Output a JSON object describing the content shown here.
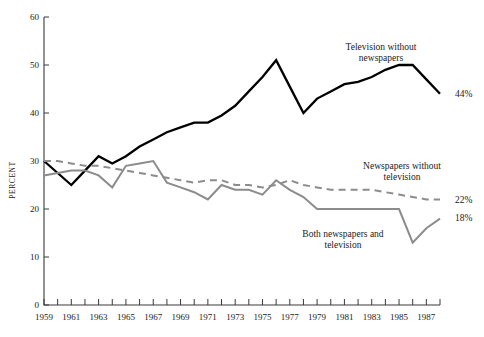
{
  "chart_data": {
    "type": "line",
    "title": "",
    "xlabel": "",
    "ylabel": "PERCENT",
    "xlim": [
      1959,
      1988
    ],
    "ylim": [
      0,
      60
    ],
    "grid": false,
    "legend_position": "inline-annotations",
    "x_tick_labels": [
      "1959",
      "1961",
      "1963",
      "1965",
      "1967",
      "1969",
      "1971",
      "1973",
      "1975",
      "1977",
      "1979",
      "1981",
      "1983",
      "1985",
      "1987"
    ],
    "y_tick_labels": [
      "0",
      "10",
      "20",
      "30",
      "40",
      "50",
      "60"
    ],
    "x_tick_values": [
      1959,
      1961,
      1963,
      1965,
      1967,
      1969,
      1971,
      1973,
      1975,
      1977,
      1979,
      1981,
      1983,
      1985,
      1987
    ],
    "y_tick_values": [
      0,
      10,
      20,
      30,
      40,
      50,
      60
    ],
    "x": [
      1959,
      1960,
      1961,
      1962,
      1963,
      1964,
      1965,
      1966,
      1967,
      1968,
      1969,
      1970,
      1971,
      1972,
      1973,
      1974,
      1975,
      1976,
      1977,
      1978,
      1979,
      1980,
      1981,
      1982,
      1983,
      1984,
      1985,
      1986,
      1987,
      1988
    ],
    "series": [
      {
        "name": "Television without newspapers",
        "color": "#000000",
        "style": "solid",
        "end_label": "44%",
        "annotation": "Television without newspapers",
        "values": [
          30,
          27.5,
          25,
          28,
          31,
          29.5,
          31,
          33,
          34.5,
          36,
          37,
          38,
          38,
          39.5,
          41.5,
          44.5,
          47.5,
          51,
          45.5,
          40,
          43,
          44.5,
          46,
          46.5,
          47.5,
          49,
          50,
          50,
          47,
          44
        ]
      },
      {
        "name": "Newspapers without television",
        "color": "#8c8c8c",
        "style": "dashed",
        "end_label": "22%",
        "annotation": "Newspapers without television",
        "values": [
          30,
          30,
          29.5,
          29,
          29,
          28.5,
          28,
          27.5,
          27,
          26.5,
          26,
          25.5,
          26,
          26,
          25,
          25,
          24.5,
          25,
          26,
          25,
          24.5,
          24,
          24,
          24,
          24,
          23.5,
          23,
          22.5,
          22,
          22
        ]
      },
      {
        "name": "Both newspapers and television",
        "color": "#8c8c8c",
        "style": "solid",
        "end_label": "18%",
        "annotation": "Both newspapers and television",
        "values": [
          27,
          27.5,
          28,
          28,
          27,
          24.5,
          29,
          29.5,
          30,
          25.5,
          24.5,
          23.5,
          22,
          25,
          24,
          24,
          23,
          26,
          24,
          22.5,
          20,
          20,
          20,
          20,
          20,
          20,
          20,
          13,
          16,
          18
        ]
      }
    ],
    "annotations": [
      {
        "text_line1": "Television without",
        "text_line2": "newspapers",
        "x_px": 381,
        "y_px": 50
      },
      {
        "text_line1": "Newspapers without",
        "text_line2": "television",
        "x_px": 402,
        "y_px": 169
      },
      {
        "text_line1": "Both newspapers and",
        "text_line2": "television",
        "x_px": 343,
        "y_px": 237
      }
    ],
    "end_labels": [
      {
        "text": "44%",
        "x_px": 455,
        "y_px": 97
      },
      {
        "text": "22%",
        "x_px": 455,
        "y_px": 203
      },
      {
        "text": "18%",
        "x_px": 455,
        "y_px": 221
      }
    ]
  }
}
